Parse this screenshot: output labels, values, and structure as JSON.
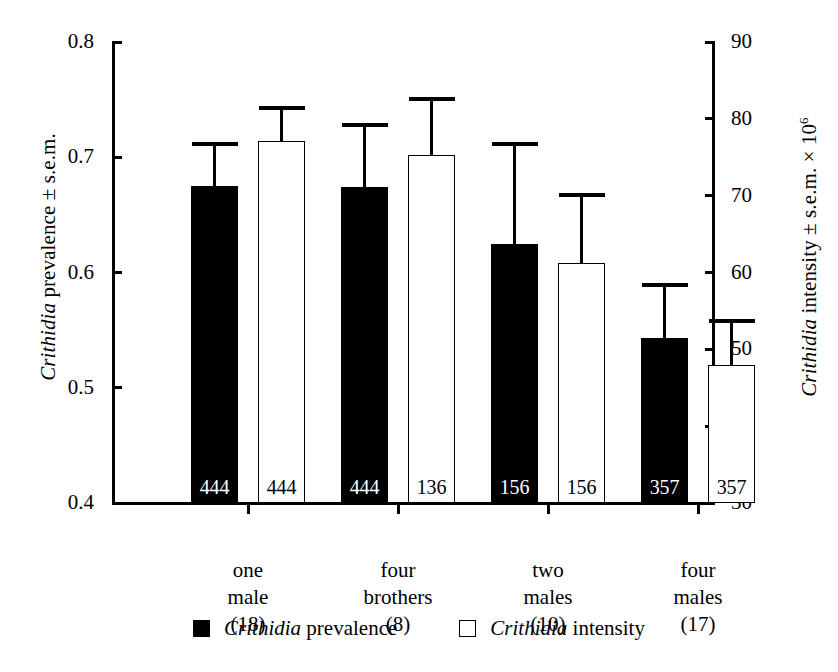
{
  "chart_data": {
    "type": "bar",
    "title": "",
    "subtitle": "",
    "categories": [
      "one male",
      "four brothers",
      "two males",
      "four males"
    ],
    "category_lines": [
      [
        "one",
        "male",
        "(18)"
      ],
      [
        "four",
        "brothers",
        "(8)"
      ],
      [
        "two",
        "males",
        "(10)"
      ],
      [
        "four",
        "males",
        "(17)"
      ]
    ],
    "sample_sizes": [
      "(18)",
      "(8)",
      "(10)",
      "(17)"
    ],
    "series": [
      {
        "name": "Crithidia prevalence",
        "name_italic_prefix": "Crithidia",
        "name_plain_suffix": "prevalence",
        "axis": "left",
        "style": "filled",
        "values": [
          0.675,
          0.674,
          0.625,
          0.543
        ],
        "errors": [
          0.038,
          0.056,
          0.088,
          0.048
        ],
        "error_upper": [
          0.713,
          0.73,
          0.713,
          0.591
        ],
        "bar_labels": [
          "444",
          "444",
          "156",
          "357"
        ]
      },
      {
        "name": "Crithidia intensity",
        "name_italic_prefix": "Crithidia",
        "name_plain_suffix": "intensity",
        "axis": "right",
        "style": "open",
        "values": [
          77.1,
          75.3,
          61.2,
          48.0
        ],
        "errors": [
          4.6,
          7.5,
          9.1,
          5.9
        ],
        "error_upper": [
          81.7,
          82.8,
          70.3,
          53.9
        ],
        "bar_labels": [
          "444",
          "136",
          "156",
          "357"
        ]
      }
    ],
    "bar_labels_in_order": [
      "444",
      "444",
      "136",
      "136",
      "156",
      "156",
      "357",
      "357"
    ],
    "left_axis": {
      "label_italic": "Crithidia",
      "label_rest": " prevalence ± s.e.m.",
      "ticks": [
        "0.8",
        "0.7",
        "0.6",
        "0.5",
        "0.4"
      ],
      "tick_values": [
        0.8,
        0.7,
        0.6,
        0.5,
        0.4
      ],
      "min": 0.4,
      "max": 0.8
    },
    "right_axis": {
      "label_italic": "Crithidia",
      "label_rest": " intensity ± s.e.m. × 10",
      "label_superscript": "6",
      "ticks": [
        "90",
        "80",
        "70",
        "60",
        "50",
        "40",
        "30"
      ],
      "tick_values": [
        90,
        80,
        70,
        60,
        50,
        40,
        30
      ],
      "min": 30,
      "max": 90
    },
    "xlabel": "",
    "grid": false,
    "legend_position": "bottom",
    "colors": {
      "prevalence": "#000000",
      "intensity": "#ffffff",
      "outline": "#000000",
      "background": "#ffffff"
    }
  },
  "legend": {
    "items": [
      {
        "swatch": "filled",
        "italic": "Crithidia",
        "rest": " prevalence"
      },
      {
        "swatch": "open",
        "italic": "Crithidia",
        "rest": " intensity"
      }
    ]
  }
}
